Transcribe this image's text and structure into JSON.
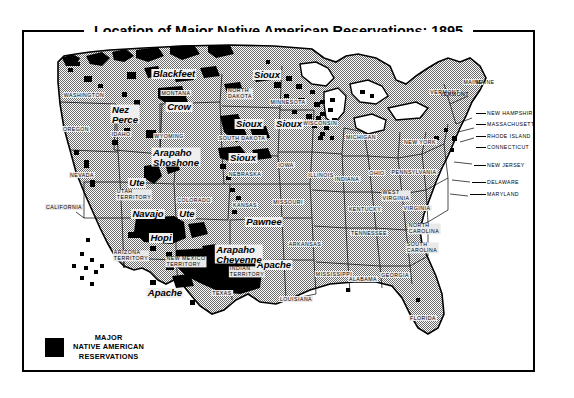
{
  "figure": {
    "title": "Location of Major Native American Reservations: 1895",
    "colors": {
      "land_fill": "#a9a9a9",
      "reservation_fill": "#000000",
      "water_fill": "#ffffff",
      "border": "#000000",
      "label_halo": "#e9e9e9"
    }
  },
  "legend": {
    "swatch_color": "#000000",
    "line1": "MAJOR",
    "line2": "NATIVE AMERICAN",
    "line3": "RESERVATIONS"
  },
  "states": [
    {
      "name": "WASHINGTON",
      "x": 60,
      "y": 63
    },
    {
      "name": "OREGON",
      "x": 52,
      "y": 97
    },
    {
      "name": "IDAHO",
      "x": 97,
      "y": 102
    },
    {
      "name": "MONTANA",
      "x": 152,
      "y": 61
    },
    {
      "name": "NORTH DAKOTA",
      "x": 216,
      "y": 62,
      "lines": [
        "NORTH",
        "DAKOTA"
      ]
    },
    {
      "name": "SOUTH DAKOTA",
      "x": 218,
      "y": 106
    },
    {
      "name": "WYOMING",
      "x": 145,
      "y": 104
    },
    {
      "name": "NEBRASKA",
      "x": 221,
      "y": 142
    },
    {
      "name": "MINNESOTA",
      "x": 264,
      "y": 70
    },
    {
      "name": "IOWA",
      "x": 262,
      "y": 133
    },
    {
      "name": "WISCONSIN",
      "x": 296,
      "y": 91
    },
    {
      "name": "MICHIGAN",
      "x": 337,
      "y": 105
    },
    {
      "name": "NEVADA",
      "x": 58,
      "y": 143
    },
    {
      "name": "CALIFORNIA",
      "x": 40,
      "y": 175
    },
    {
      "name": "UTAH TERRITORY",
      "x": 110,
      "y": 163,
      "lines": [
        "UTAH",
        "TERRITORY"
      ]
    },
    {
      "name": "COLORADO",
      "x": 170,
      "y": 168
    },
    {
      "name": "KANSAS",
      "x": 221,
      "y": 173
    },
    {
      "name": "MISSOURI",
      "x": 264,
      "y": 170
    },
    {
      "name": "ILLINOIS",
      "x": 297,
      "y": 143
    },
    {
      "name": "INDIANA",
      "x": 323,
      "y": 147
    },
    {
      "name": "OHIO",
      "x": 353,
      "y": 141
    },
    {
      "name": "KENTUCKY",
      "x": 341,
      "y": 177
    },
    {
      "name": "TENNESSEE",
      "x": 345,
      "y": 201
    },
    {
      "name": "ARKANSAS",
      "x": 281,
      "y": 212
    },
    {
      "name": "ARIZONA TERRITORY",
      "x": 107,
      "y": 224,
      "lines": [
        "ARIZONA",
        "TERRITORY"
      ]
    },
    {
      "name": "NEW MEXICO TERRITORY",
      "x": 162,
      "y": 230,
      "lines": [
        "NEW MEXICO",
        "TERRITORY"
      ]
    },
    {
      "name": "INDIAN TERRITORY",
      "x": 223,
      "y": 240,
      "lines": [
        "INDIAN",
        "TERRITORY"
      ]
    },
    {
      "name": "TEXAS",
      "x": 198,
      "y": 261
    },
    {
      "name": "LOUISIANA",
      "x": 272,
      "y": 267
    },
    {
      "name": "MISSISSIPPI",
      "x": 310,
      "y": 242
    },
    {
      "name": "ALABAMA",
      "x": 339,
      "y": 247
    },
    {
      "name": "GEORGIA",
      "x": 371,
      "y": 243
    },
    {
      "name": "FLORIDA",
      "x": 399,
      "y": 286
    },
    {
      "name": "SOUTH CAROLINA",
      "x": 398,
      "y": 216,
      "lines": [
        "SOUTH",
        "CAROLINA"
      ]
    },
    {
      "name": "NORTH CAROLINA",
      "x": 400,
      "y": 197,
      "lines": [
        "NORTH",
        "CAROLINA"
      ]
    },
    {
      "name": "VIRGINIA",
      "x": 393,
      "y": 176
    },
    {
      "name": "WEST VIRGINIA",
      "x": 372,
      "y": 164,
      "lines": [
        "WEST",
        "VIRGINIA"
      ]
    },
    {
      "name": "PENNSYLVANIA",
      "x": 390,
      "y": 140
    },
    {
      "name": "NEW YORK",
      "x": 396,
      "y": 110
    },
    {
      "name": "VERMONT",
      "x": 421,
      "y": 60
    },
    {
      "name": "MAINE",
      "x": 449,
      "y": 50
    }
  ],
  "edge_states": [
    {
      "name": "MAINE",
      "x": 452,
      "y": 50,
      "leader": null
    },
    {
      "name": "VERMONT",
      "x": 416,
      "y": 62,
      "leader": null
    },
    {
      "name": "NEW HAMPSHIRE",
      "x": 463,
      "y": 81,
      "leader": {
        "x": 452,
        "y": 81,
        "w": 10
      }
    },
    {
      "name": "MASSACHUSETTS",
      "x": 463,
      "y": 92,
      "leader": {
        "x": 452,
        "y": 92,
        "w": 10
      }
    },
    {
      "name": "RHODE ISLAND",
      "x": 463,
      "y": 104,
      "leader": {
        "x": 452,
        "y": 104,
        "w": 10
      }
    },
    {
      "name": "CONNECTICUT",
      "x": 463,
      "y": 115,
      "leader": {
        "x": 452,
        "y": 115,
        "w": 10
      }
    },
    {
      "name": "NEW JERSEY",
      "x": 463,
      "y": 133,
      "leader": {
        "x": 450,
        "y": 133,
        "w": 12
      }
    },
    {
      "name": "DELAWARE",
      "x": 463,
      "y": 150,
      "leader": {
        "x": 448,
        "y": 150,
        "w": 14
      }
    },
    {
      "name": "MARYLAND",
      "x": 463,
      "y": 162,
      "leader": {
        "x": 446,
        "y": 162,
        "w": 16
      }
    }
  ],
  "tribes": [
    {
      "name": "Blackfeet",
      "x": 150,
      "y": 42
    },
    {
      "name": "Sioux",
      "x": 243,
      "y": 43
    },
    {
      "name": "Nez Perce",
      "x": 101,
      "y": 82,
      "lines": [
        "Nez",
        "Perce"
      ]
    },
    {
      "name": "Crow",
      "x": 155,
      "y": 75
    },
    {
      "name": "Sioux",
      "x": 225,
      "y": 92
    },
    {
      "name": "Sioux",
      "x": 265,
      "y": 92
    },
    {
      "name": "Arapaho Shoshone",
      "x": 152,
      "y": 125,
      "lines": [
        "Arapaho",
        "Shoshone"
      ]
    },
    {
      "name": "Sioux",
      "x": 219,
      "y": 126
    },
    {
      "name": "Ute",
      "x": 113,
      "y": 151
    },
    {
      "name": "Ute",
      "x": 163,
      "y": 182
    },
    {
      "name": "Navajo",
      "x": 124,
      "y": 182
    },
    {
      "name": "Hopi",
      "x": 137,
      "y": 206
    },
    {
      "name": "Apache",
      "x": 141,
      "y": 261
    },
    {
      "name": "Apache",
      "x": 250,
      "y": 233
    },
    {
      "name": "Arapaho Cheyenne",
      "x": 215,
      "y": 222,
      "lines": [
        "Arapaho",
        "Cheyenne"
      ]
    },
    {
      "name": "Pawnee",
      "x": 240,
      "y": 190
    }
  ]
}
